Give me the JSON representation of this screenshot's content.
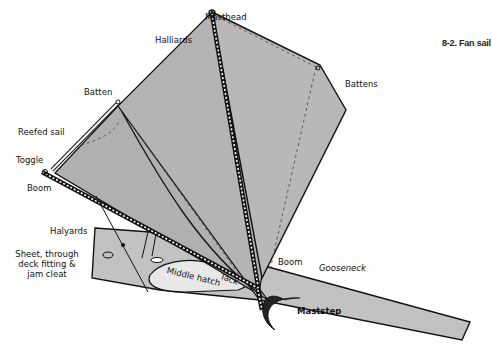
{
  "figure": {
    "caption": "8-2. Fan sail",
    "colors": {
      "sail": "#b4b4b4",
      "deck": "#c2c2c2",
      "hatch": "#e8e8e8",
      "outline": "#111111",
      "background": "#ffffff"
    }
  },
  "labels": {
    "masthead": "Masthead",
    "halliards": "Halliards",
    "battens": "Battens",
    "batten": "Batten",
    "reefed_sail": "Reefed sail",
    "toggle": "Toggle",
    "boom_left": "Boom",
    "halyards": "Halyards",
    "sheet_line1": "Sheet, through",
    "sheet_line2": "deck fitting &",
    "sheet_line3": "jam cleat",
    "middle_hatch": "Middle hatch",
    "tack": "Tack",
    "boom_right": "Boom",
    "gooseneck": "Gooseneck",
    "maststep": "Maststep"
  }
}
